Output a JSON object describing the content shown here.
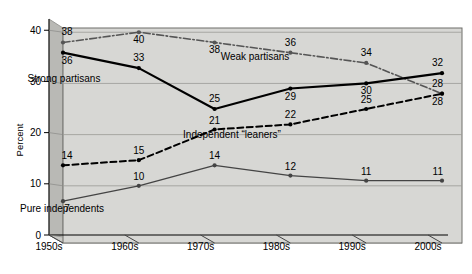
{
  "chart_data": {
    "type": "line",
    "title": "",
    "xlabel": "",
    "ylabel": "Percent",
    "categories": [
      "1950s",
      "1960s",
      "1970s",
      "1980s",
      "1990s",
      "2000s"
    ],
    "ylim": [
      0,
      42
    ],
    "yticks": [
      "0",
      "10",
      "20",
      "30",
      "40"
    ],
    "ytick_values": [
      0,
      10,
      20,
      30,
      40
    ],
    "grid": true,
    "legend": "inline-annotations",
    "series": [
      {
        "name": "Weak partisans",
        "style": "dash-dot",
        "color": "#555555",
        "values": [
          38,
          40,
          38,
          36,
          34,
          28
        ],
        "labels": [
          "38",
          "40",
          "38",
          "36",
          "34",
          "28"
        ]
      },
      {
        "name": "Strong partisans",
        "style": "solid-thick",
        "color": "#000000",
        "values": [
          36,
          33,
          25,
          29,
          30,
          32
        ],
        "labels": [
          "36",
          "33",
          "25",
          "29",
          "30",
          "32"
        ]
      },
      {
        "name": "Independent “leaners”",
        "style": "dashed",
        "color": "#000000",
        "values": [
          14,
          15,
          21,
          22,
          25,
          28
        ],
        "labels": [
          "14",
          "15",
          "21",
          "22",
          "25",
          "28"
        ]
      },
      {
        "name": "Pure independents",
        "style": "solid-thin",
        "color": "#444444",
        "values": [
          7,
          10,
          14,
          12,
          11,
          11
        ],
        "labels": [
          "7",
          "10",
          "14",
          "12",
          "11",
          "11"
        ]
      }
    ],
    "annotations": [
      {
        "text": "Weak partisans",
        "x": 255,
        "y": 60
      },
      {
        "text": "Strong partisans",
        "x": 64,
        "y": 82
      },
      {
        "text": "Independent “leaners”",
        "x": 232,
        "y": 138
      },
      {
        "text": "Pure independents",
        "x": 62,
        "y": 212
      }
    ],
    "plot_background": "#d7d7d4"
  },
  "axis": {
    "y_title": "Percent"
  }
}
